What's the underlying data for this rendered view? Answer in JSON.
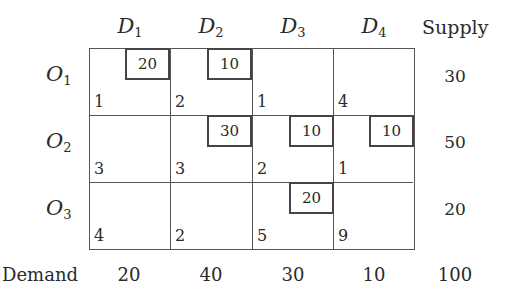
{
  "table": {
    "columns": [
      {
        "letter": "D",
        "sub": "1"
      },
      {
        "letter": "D",
        "sub": "2"
      },
      {
        "letter": "D",
        "sub": "3"
      },
      {
        "letter": "D",
        "sub": "4"
      }
    ],
    "supply_header": "Supply",
    "rows": [
      {
        "letter": "O",
        "sub": "1",
        "supply": "30",
        "costs": [
          "1",
          "2",
          "1",
          "4"
        ],
        "allocations": [
          "20",
          "10",
          "",
          ""
        ]
      },
      {
        "letter": "O",
        "sub": "2",
        "supply": "50",
        "costs": [
          "3",
          "3",
          "2",
          "1"
        ],
        "allocations": [
          "",
          "30",
          "10",
          "10"
        ]
      },
      {
        "letter": "O",
        "sub": "3",
        "supply": "20",
        "costs": [
          "4",
          "2",
          "5",
          "9"
        ],
        "allocations": [
          "",
          "",
          "20",
          ""
        ]
      }
    ],
    "demand_label": "Demand",
    "demand": [
      "20",
      "40",
      "30",
      "10"
    ],
    "total": "100"
  }
}
